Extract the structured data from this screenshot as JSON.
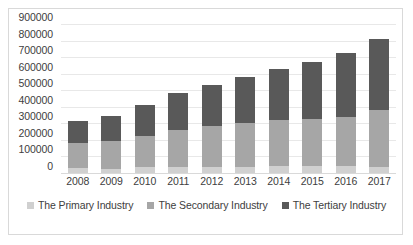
{
  "chart_data": {
    "type": "bar",
    "stacked": true,
    "title": "",
    "xlabel": "",
    "ylabel": "",
    "categories": [
      "2008",
      "2009",
      "2010",
      "2011",
      "2012",
      "2013",
      "2014",
      "2015",
      "2016",
      "2017"
    ],
    "series": [
      {
        "name": "The Primary Industry",
        "color": "#d0d0d0",
        "values": [
          33000,
          25000,
          36000,
          36000,
          38000,
          35000,
          45000,
          41000,
          41000,
          36000
        ]
      },
      {
        "name": "The Secondary Industry",
        "color": "#a6a6a6",
        "values": [
          147000,
          167000,
          190000,
          223000,
          246000,
          268000,
          273000,
          283000,
          299000,
          344000
        ]
      },
      {
        "name": "The Tertiary Industry",
        "color": "#595959",
        "values": [
          134000,
          151000,
          183000,
          223000,
          245000,
          280000,
          312000,
          348000,
          385000,
          430000
        ]
      }
    ],
    "totals": [
      314000,
      343000,
      409000,
      482000,
      529000,
      583000,
      630000,
      672000,
      725000,
      810000
    ],
    "y_ticks": [
      "900000",
      "800000",
      "700000",
      "600000",
      "500000",
      "400000",
      "300000",
      "200000",
      "100000",
      "0"
    ],
    "ylim": [
      0,
      900000
    ],
    "y_tick_step": 100000,
    "grid": true,
    "legend_position": "bottom",
    "legend": [
      {
        "label": "The Primary Industry",
        "color": "#d0d0d0"
      },
      {
        "label": "The Secondary Industry",
        "color": "#a6a6a6"
      },
      {
        "label": "The Tertiary Industry",
        "color": "#595959"
      }
    ]
  }
}
